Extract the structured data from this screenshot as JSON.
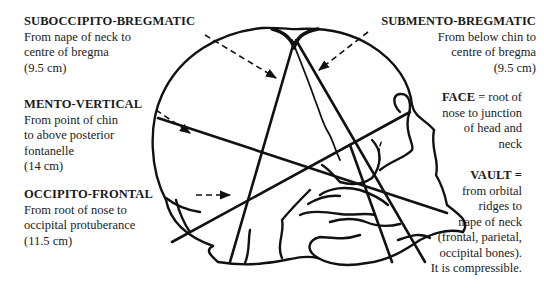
{
  "diagram": {
    "labels": {
      "suboccipito_bregmatic": {
        "title": "SUBOCCIPITO-BREGMATIC",
        "lines": [
          "From nape of neck to",
          "centre of bregma",
          "(9.5 cm)"
        ]
      },
      "mento_vertical": {
        "title": "MENTO-VERTICAL",
        "lines": [
          "From point of chin",
          "to above posterior",
          "fontanelle",
          "(14 cm)"
        ]
      },
      "occipito_frontal": {
        "title": "OCCIPITO-FRONTAL",
        "lines": [
          "From root of nose to",
          "occipital protuberance",
          "(11.5 cm)"
        ]
      },
      "submento_bregmatic": {
        "title": "SUBMENTO-BREGMATIC",
        "lines": [
          "From below chin to",
          "centre of bregma",
          "(9.5 cm)"
        ]
      },
      "face": {
        "title": "FACE",
        "title_suffix": " = root of",
        "lines": [
          "nose to junction",
          "of head and",
          "neck"
        ]
      },
      "vault": {
        "title": "VAULT =",
        "lines": [
          "from orbital",
          "ridges to",
          "nape of neck",
          "(frontal, parietal,",
          "occipital bones).",
          "It is compressible."
        ]
      }
    },
    "measurements_cm": {
      "suboccipito_bregmatic": 9.5,
      "mento_vertical": 14,
      "occipito_frontal": 11.5,
      "submento_bregmatic": 9.5
    },
    "colors": {
      "ink": "#111111",
      "background": "#ffffff"
    }
  }
}
